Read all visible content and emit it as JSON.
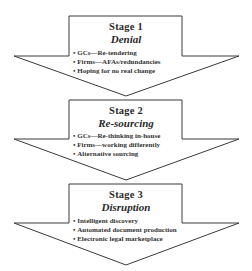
{
  "stages": [
    {
      "number": "Stage 1",
      "name": "Denial",
      "bullets": [
        "GCs—Re-tendering",
        "Firms—AFAs/redundancies",
        "Hoping for no real change"
      ]
    },
    {
      "number": "Stage 2",
      "name": "Re-sourcing",
      "bullets": [
        "GCs—Re-thinking in-house",
        "Firms—working differently",
        "Alternative sourcing"
      ]
    },
    {
      "number": "Stage 3",
      "name": "Disruption",
      "bullets": [
        "Intelligent discovery",
        "Automated document production",
        "Electronic legal marketplace"
      ]
    }
  ],
  "colors": {
    "stroke": "#3a3a3a",
    "fill": "#ffffff"
  }
}
